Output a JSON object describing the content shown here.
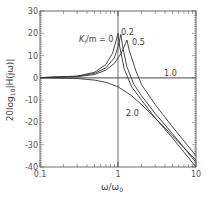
{
  "chart_data": {
    "type": "line",
    "title": "",
    "xlabel": "ω/ω₀",
    "ylabel": "20log₁₀|H(jω)|",
    "xscale": "log",
    "xlim": [
      0.1,
      10
    ],
    "ylim": [
      -40,
      30
    ],
    "xticks": [
      "0.1",
      "1",
      "10"
    ],
    "yticks": [
      "30",
      "20",
      "10",
      "0",
      "-10",
      "-20",
      "-30",
      "-40"
    ],
    "grid": false,
    "legend": "inline annotations",
    "annotation_prefix": "Kf/m = 0",
    "series": [
      {
        "name": "0",
        "label": "Kf/m = 0",
        "x": [
          0.1,
          0.3,
          0.5,
          0.7,
          0.85,
          0.95,
          1.0,
          1.05,
          1.2,
          1.5,
          2,
          3,
          5,
          10
        ],
        "y": [
          0.1,
          0.8,
          2.5,
          6,
          11,
          17,
          20,
          14,
          4,
          -4,
          -10,
          -18,
          -27,
          -40
        ]
      },
      {
        "name": "0.2",
        "label": "0.2",
        "x": [
          0.1,
          0.3,
          0.5,
          0.7,
          0.9,
          1.0,
          1.09,
          1.15,
          1.3,
          1.6,
          2,
          3,
          5,
          10
        ],
        "y": [
          0.1,
          0.7,
          2,
          4.5,
          9,
          14,
          19.5,
          14,
          5,
          -3,
          -8,
          -16,
          -25,
          -38
        ]
      },
      {
        "name": "0.5",
        "label": "0.5",
        "x": [
          0.1,
          0.3,
          0.5,
          0.7,
          0.9,
          1.1,
          1.25,
          1.3,
          1.4,
          1.7,
          2,
          3,
          5,
          10
        ],
        "y": [
          0.05,
          0.5,
          1.5,
          3.5,
          6.5,
          11,
          15.5,
          17,
          12,
          3,
          -3,
          -12,
          -22,
          -35
        ]
      },
      {
        "name": "1.0",
        "label": "1.0",
        "x": [
          0.1,
          1,
          10
        ],
        "y": [
          0,
          0,
          0
        ]
      },
      {
        "name": "2.0",
        "label": "2.0",
        "x": [
          0.1,
          0.3,
          0.5,
          0.7,
          1.0,
          1.5,
          2,
          3,
          5,
          10
        ],
        "y": [
          0,
          -0.3,
          -1,
          -2,
          -4,
          -8,
          -12,
          -18,
          -26,
          -37
        ]
      }
    ]
  },
  "labels": {
    "y_axis": "20log",
    "y_sub": "10",
    "y_rest": "|H(jω)|",
    "x_axis": "ω/ω",
    "x_sub": "0",
    "k_label": "K",
    "k_sub": "f",
    "k_rest": "/m = 0",
    "lbl_02": "0.2",
    "lbl_05": "0.5",
    "lbl_10": "1.0",
    "lbl_20": "2.0"
  }
}
